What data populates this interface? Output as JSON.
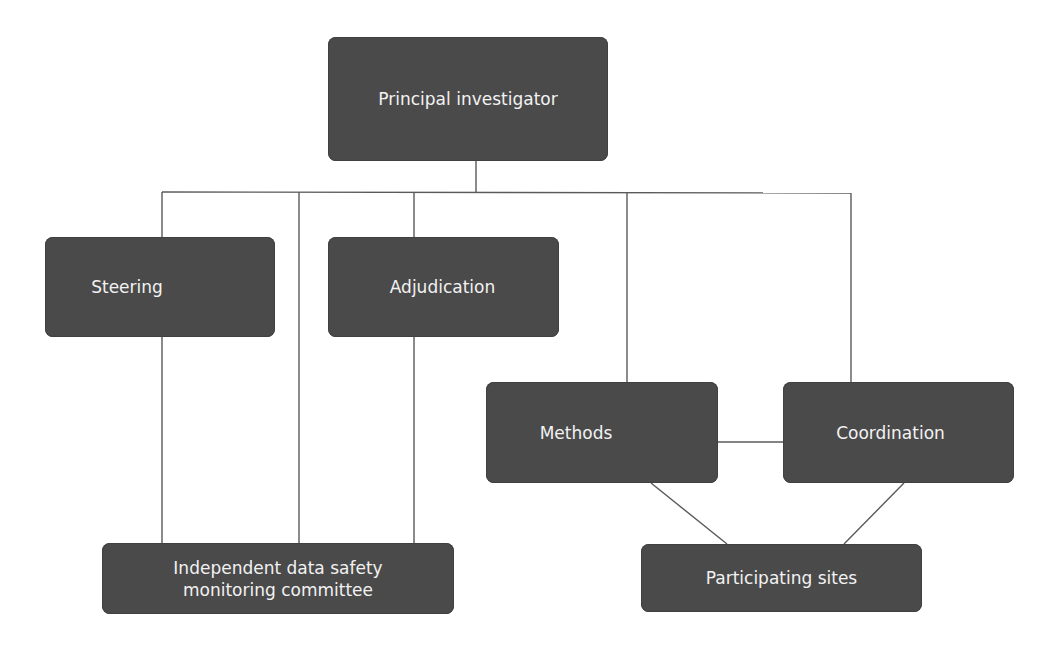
{
  "diagram": {
    "type": "organizational-chart",
    "colors": {
      "node_fill": "#4a4a4a",
      "node_text": "#f2f2f2",
      "connector": "#5a5a5a",
      "background": "#ffffff"
    },
    "nodes": {
      "principal_investigator": {
        "label": "Principal investigator"
      },
      "steering": {
        "label": "Steering"
      },
      "adjudication": {
        "label": "Adjudication"
      },
      "methods": {
        "label": "Methods"
      },
      "coordination": {
        "label": "Coordination"
      },
      "idsmc": {
        "line1": "Independent data safety",
        "line2": "monitoring committee"
      },
      "participating_sites": {
        "label": "Participating sites"
      }
    },
    "edges": [
      [
        "Principal investigator",
        "Steering"
      ],
      [
        "Principal investigator",
        "Adjudication"
      ],
      [
        "Principal investigator",
        "Independent data safety monitoring committee"
      ],
      [
        "Principal investigator",
        "Methods"
      ],
      [
        "Principal investigator",
        "Coordination"
      ],
      [
        "Steering",
        "Independent data safety monitoring committee"
      ],
      [
        "Adjudication",
        "Independent data safety monitoring committee"
      ],
      [
        "Methods",
        "Coordination"
      ],
      [
        "Methods",
        "Participating sites"
      ],
      [
        "Coordination",
        "Participating sites"
      ]
    ]
  }
}
